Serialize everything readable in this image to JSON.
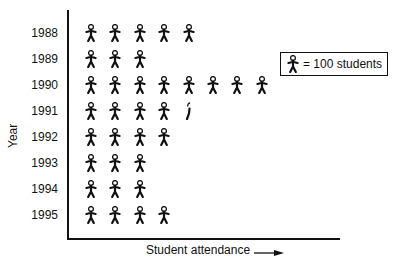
{
  "chart_data": {
    "type": "pictograph",
    "title": "",
    "xlabel": "Student attendance",
    "ylabel": "Year",
    "categories": [
      "1988",
      "1989",
      "1990",
      "1991",
      "1992",
      "1993",
      "1994",
      "1995"
    ],
    "icon_counts": [
      5,
      3,
      8,
      4.5,
      4,
      3,
      3,
      4
    ],
    "values": [
      500,
      300,
      800,
      450,
      400,
      300,
      300,
      400
    ],
    "units_per_icon": 100,
    "legend": "= 100 students",
    "grid": false
  },
  "legend": {
    "label": "= 100 students"
  },
  "axes": {
    "x_label": "Student attendance",
    "y_label": "Year"
  }
}
